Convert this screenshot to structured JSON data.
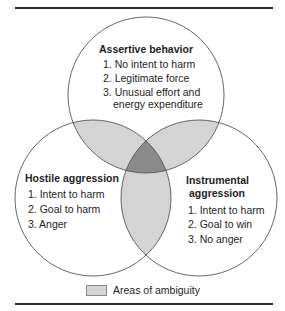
{
  "diagram": {
    "type": "venn",
    "colors": {
      "rule": "#2a2a2a",
      "circle_stroke": "#555555",
      "ambiguity_fill": "#d4d4d4",
      "center_fill": "#8a8a8a",
      "text": "#1e1e1e"
    },
    "sets": [
      {
        "id": "assertive",
        "title": "Assertive behavior",
        "items": [
          "1. No intent to harm",
          "2. Legitimate force",
          "3. Unusual effort and",
          "energy expenditure"
        ]
      },
      {
        "id": "hostile",
        "title": "Hostile aggression",
        "items": [
          "1. Intent to harm",
          "2. Goal to harm",
          "3. Anger"
        ]
      },
      {
        "id": "instrumental",
        "title_line1": "Instrumental",
        "title_line2": "aggression",
        "items": [
          "1. Intent to harm",
          "2. Goal to win",
          "3. No anger"
        ]
      }
    ],
    "legend": {
      "label": "Areas of ambiguity"
    }
  }
}
